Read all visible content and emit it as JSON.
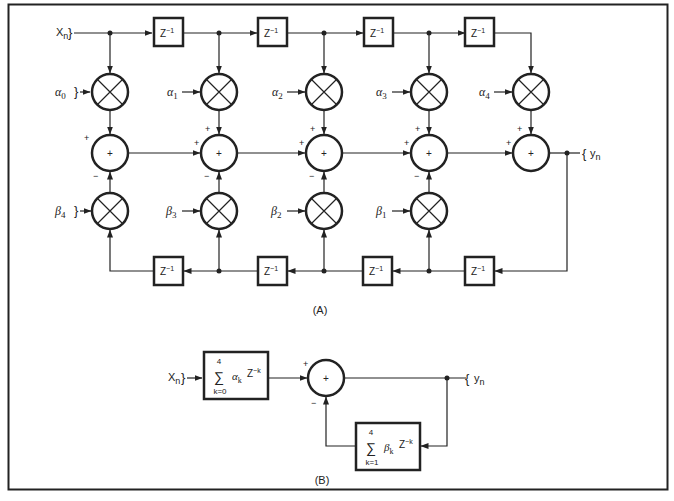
{
  "figure": {
    "panel_a": {
      "label": "(A)",
      "input_label": "X",
      "input_sub": "n",
      "output_label": "y",
      "output_sub": "n",
      "delay_label": "Z",
      "delay_exp": "−1",
      "alpha": [
        {
          "sym": "α",
          "sub": "0"
        },
        {
          "sym": "α",
          "sub": "1"
        },
        {
          "sym": "α",
          "sub": "2"
        },
        {
          "sym": "α",
          "sub": "3"
        },
        {
          "sym": "α",
          "sub": "4"
        }
      ],
      "beta": [
        {
          "sym": "β",
          "sub": "4"
        },
        {
          "sym": "β",
          "sub": "3"
        },
        {
          "sym": "β",
          "sub": "2"
        },
        {
          "sym": "β",
          "sub": "1"
        }
      ],
      "adder_symbol": "+",
      "plus_sign": "+",
      "minus_sign": "−"
    },
    "panel_b": {
      "label": "(B)",
      "input_label": "X",
      "input_sub": "n",
      "output_label": "y",
      "output_sub": "n",
      "forward_block": {
        "sum": "∑",
        "upper": "4",
        "lower": "k=0",
        "coef": "α",
        "coef_sub": "k",
        "z": "Z",
        "z_exp": "−k"
      },
      "feedback_block": {
        "sum": "∑",
        "upper": "4",
        "lower": "k=1",
        "coef": "β",
        "coef_sub": "k",
        "z": "Z",
        "z_exp": "−k"
      },
      "adder_symbol": "+",
      "plus_sign": "+",
      "minus_sign": "−"
    }
  }
}
